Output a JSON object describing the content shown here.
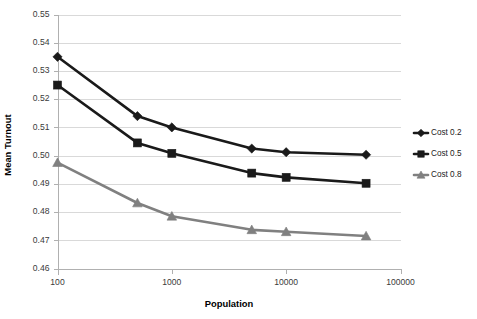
{
  "chart_data": {
    "type": "line",
    "title": "",
    "xlabel": "Population",
    "ylabel": "Mean Turnout",
    "x": [
      100,
      500,
      1000,
      5000,
      10000,
      50000
    ],
    "xscale": "log",
    "xlim": [
      100,
      100000
    ],
    "ylim": [
      0.46,
      0.55
    ],
    "grid": true,
    "legend_position": "right",
    "xticks": [
      "100",
      "1000",
      "10000",
      "100000"
    ],
    "xtick_values": [
      100,
      1000,
      10000,
      100000
    ],
    "yticks": [
      "0.46",
      "0.47",
      "0.48",
      "0.49",
      "0.50",
      "0.51",
      "0.52",
      "0.53",
      "0.54",
      "0.55"
    ],
    "ytick_values": [
      0.46,
      0.47,
      0.48,
      0.49,
      0.5,
      0.51,
      0.52,
      0.53,
      0.54,
      0.55
    ],
    "series": [
      {
        "name": "Cost 0.2",
        "marker": "diamond",
        "color": "#1a1a1a",
        "values": [
          0.535,
          0.514,
          0.51,
          0.5025,
          0.5012,
          0.5003
        ]
      },
      {
        "name": "Cost 0.5",
        "marker": "square",
        "color": "#1a1a1a",
        "values": [
          0.525,
          0.5045,
          0.5008,
          0.4938,
          0.4923,
          0.4902
        ]
      },
      {
        "name": "Cost 0.8",
        "marker": "triangle",
        "color": "#808080",
        "values": [
          0.4975,
          0.4832,
          0.4785,
          0.4737,
          0.473,
          0.4715
        ]
      }
    ]
  },
  "axes": {
    "x_title": "Population",
    "y_title": "Mean Turnout"
  },
  "legend": {
    "entries": [
      {
        "label": "Cost 0.2",
        "marker": "diamond",
        "color": "#1a1a1a"
      },
      {
        "label": "Cost 0.5",
        "marker": "square",
        "color": "#1a1a1a"
      },
      {
        "label": "Cost 0.8",
        "marker": "triangle",
        "color": "#808080"
      }
    ]
  },
  "colors": {
    "series_dark": "#1a1a1a",
    "series_gray": "#808080",
    "gridline": "#d9d9d9",
    "axis": "#b0b0b0",
    "background": "#ffffff"
  }
}
